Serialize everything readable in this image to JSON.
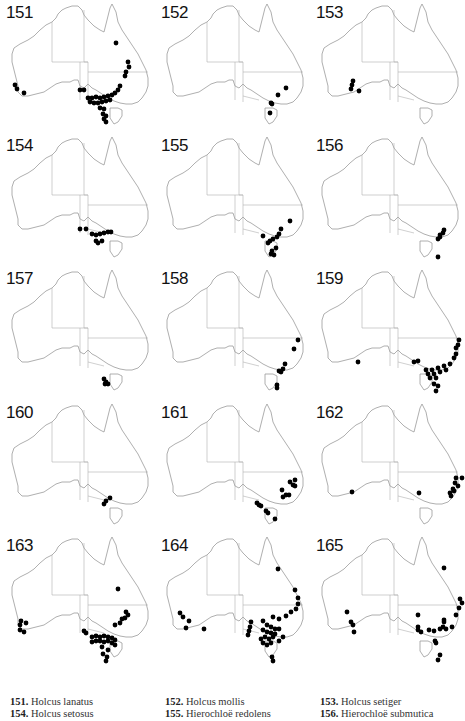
{
  "figure": {
    "type": "distribution-maps",
    "region": "Australia",
    "map_style": {
      "outline_color": "#9a9a9a",
      "border_color": "#b0b0b0",
      "dot_color": "#000000"
    }
  },
  "panels": [
    {
      "number": "151",
      "species": "Holcus lanatus",
      "dots": [
        [
          116,
          43
        ],
        [
          128,
          62
        ],
        [
          129,
          67
        ],
        [
          126,
          72
        ],
        [
          125,
          76
        ],
        [
          15,
          85
        ],
        [
          17,
          89
        ],
        [
          24,
          93
        ],
        [
          80,
          90
        ],
        [
          84,
          90
        ],
        [
          88,
          98
        ],
        [
          92,
          98
        ],
        [
          96,
          97
        ],
        [
          100,
          98
        ],
        [
          104,
          97
        ],
        [
          108,
          96
        ],
        [
          112,
          95
        ],
        [
          115,
          93
        ],
        [
          118,
          90
        ],
        [
          120,
          86
        ],
        [
          90,
          102
        ],
        [
          94,
          103
        ],
        [
          98,
          103
        ],
        [
          102,
          102
        ],
        [
          106,
          101
        ],
        [
          110,
          100
        ],
        [
          100,
          108
        ],
        [
          104,
          109
        ],
        [
          103,
          114
        ],
        [
          106,
          116
        ],
        [
          104,
          119
        ],
        [
          106,
          122
        ]
      ]
    },
    {
      "number": "152",
      "species": "Holcus mollis",
      "dots": [
        [
          131,
          88
        ],
        [
          123,
          95
        ],
        [
          116,
          103
        ],
        [
          117,
          104
        ],
        [
          115,
          113
        ]
      ]
    },
    {
      "number": "153",
      "species": "Holcus setiger",
      "dots": [
        [
          43,
          81
        ],
        [
          42,
          85
        ],
        [
          41,
          89
        ],
        [
          49,
          91
        ]
      ]
    },
    {
      "number": "154",
      "species": "Holcus setosus",
      "dots": [
        [
          80,
          96
        ],
        [
          86,
          96
        ],
        [
          92,
          101
        ],
        [
          96,
          102
        ],
        [
          100,
          101
        ],
        [
          104,
          100
        ],
        [
          108,
          99
        ],
        [
          111,
          99
        ],
        [
          96,
          108
        ],
        [
          102,
          108
        ],
        [
          98,
          110
        ]
      ]
    },
    {
      "number": "155",
      "species": "Hierochloë redolens",
      "dots": [
        [
          135,
          88
        ],
        [
          126,
          96
        ],
        [
          124,
          101
        ],
        [
          122,
          104
        ],
        [
          118,
          106
        ],
        [
          115,
          108
        ],
        [
          113,
          110
        ],
        [
          108,
          103
        ],
        [
          121,
          115
        ],
        [
          117,
          118
        ],
        [
          116,
          121
        ],
        [
          119,
          122
        ]
      ]
    },
    {
      "number": "156",
      "species": "Hierochloë submutica",
      "dots": [
        [
          134,
          97
        ],
        [
          133,
          100
        ],
        [
          130,
          102
        ],
        [
          130,
          104
        ],
        [
          128,
          106
        ],
        [
          128,
          124
        ]
      ]
    },
    {
      "number": "157",
      "species": "",
      "dots": [
        [
          104,
          113
        ],
        [
          106,
          116
        ],
        [
          105,
          118
        ],
        [
          108,
          118
        ]
      ]
    },
    {
      "number": "158",
      "species": "",
      "dots": [
        [
          143,
          74
        ],
        [
          139,
          83
        ],
        [
          130,
          98
        ],
        [
          128,
          103
        ],
        [
          124,
          105
        ],
        [
          126,
          106
        ],
        [
          122,
          119
        ],
        [
          122,
          122
        ]
      ]
    },
    {
      "number": "159",
      "species": "",
      "dots": [
        [
          149,
          74
        ],
        [
          148,
          79
        ],
        [
          146,
          82
        ],
        [
          104,
          96
        ],
        [
          108,
          95
        ],
        [
          48,
          96
        ],
        [
          116,
          104
        ],
        [
          122,
          104
        ],
        [
          128,
          102
        ],
        [
          134,
          100
        ],
        [
          140,
          98
        ],
        [
          144,
          92
        ],
        [
          146,
          88
        ],
        [
          118,
          108
        ],
        [
          124,
          108
        ],
        [
          130,
          106
        ],
        [
          136,
          104
        ],
        [
          120,
          112
        ],
        [
          126,
          112
        ],
        [
          124,
          118
        ],
        [
          128,
          120
        ],
        [
          126,
          125
        ]
      ]
    },
    {
      "number": "160",
      "species": "",
      "dots": [
        [
          110,
          98
        ],
        [
          106,
          101
        ],
        [
          104,
          104
        ]
      ]
    },
    {
      "number": "161",
      "species": "",
      "dots": [
        [
          140,
          80
        ],
        [
          135,
          82
        ],
        [
          138,
          85
        ],
        [
          140,
          86
        ],
        [
          127,
          90
        ],
        [
          131,
          95
        ],
        [
          134,
          95
        ],
        [
          128,
          97
        ],
        [
          102,
          103
        ],
        [
          104,
          105
        ],
        [
          106,
          106
        ],
        [
          111,
          111
        ],
        [
          120,
          119
        ],
        [
          113,
          113
        ]
      ]
    },
    {
      "number": "162",
      "species": "",
      "dots": [
        [
          42,
          92
        ],
        [
          109,
          93
        ],
        [
          146,
          78
        ],
        [
          152,
          78
        ],
        [
          145,
          83
        ],
        [
          148,
          86
        ],
        [
          143,
          89
        ],
        [
          144,
          91
        ],
        [
          141,
          96
        ],
        [
          140,
          93
        ]
      ]
    },
    {
      "number": "163",
      "species": "",
      "dots": [
        [
          118,
          56
        ],
        [
          126,
          79
        ],
        [
          128,
          82
        ],
        [
          125,
          85
        ],
        [
          122,
          86
        ],
        [
          120,
          90
        ],
        [
          115,
          92
        ],
        [
          21,
          88
        ],
        [
          26,
          90
        ],
        [
          20,
          92
        ],
        [
          20,
          97
        ],
        [
          24,
          99
        ],
        [
          84,
          98
        ],
        [
          86,
          100
        ],
        [
          92,
          104
        ],
        [
          96,
          103
        ],
        [
          100,
          104
        ],
        [
          104,
          103
        ],
        [
          108,
          104
        ],
        [
          112,
          105
        ],
        [
          115,
          107
        ],
        [
          92,
          109
        ],
        [
          96,
          108
        ],
        [
          100,
          108
        ],
        [
          104,
          109
        ],
        [
          108,
          108
        ],
        [
          112,
          110
        ],
        [
          115,
          112
        ],
        [
          102,
          114
        ],
        [
          108,
          117
        ],
        [
          103,
          121
        ],
        [
          107,
          124
        ],
        [
          106,
          128
        ]
      ]
    },
    {
      "number": "164",
      "species": "",
      "dots": [
        [
          123,
          36
        ],
        [
          140,
          57
        ],
        [
          143,
          65
        ],
        [
          143,
          71
        ],
        [
          141,
          76
        ],
        [
          136,
          79
        ],
        [
          131,
          83
        ],
        [
          118,
          84
        ],
        [
          124,
          86
        ],
        [
          25,
          80
        ],
        [
          28,
          84
        ],
        [
          34,
          88
        ],
        [
          31,
          95
        ],
        [
          49,
          96
        ],
        [
          96,
          89
        ],
        [
          95,
          94
        ],
        [
          94,
          98
        ],
        [
          93,
          102
        ],
        [
          108,
          88
        ],
        [
          112,
          92
        ],
        [
          116,
          94
        ],
        [
          120,
          96
        ],
        [
          124,
          96
        ],
        [
          108,
          97
        ],
        [
          112,
          99
        ],
        [
          116,
          100
        ],
        [
          120,
          101
        ],
        [
          110,
          104
        ],
        [
          114,
          106
        ],
        [
          118,
          104
        ],
        [
          106,
          106
        ],
        [
          108,
          110
        ],
        [
          112,
          112
        ],
        [
          116,
          110
        ],
        [
          124,
          108
        ],
        [
          128,
          104
        ],
        [
          117,
          124
        ],
        [
          118,
          128
        ]
      ]
    },
    {
      "number": "165",
      "species": "",
      "dots": [
        [
          134,
          35
        ],
        [
          150,
          66
        ],
        [
          152,
          70
        ],
        [
          149,
          75
        ],
        [
          146,
          82
        ],
        [
          134,
          87
        ],
        [
          37,
          79
        ],
        [
          41,
          89
        ],
        [
          43,
          92
        ],
        [
          44,
          99
        ],
        [
          108,
          82
        ],
        [
          108,
          94
        ],
        [
          108,
          97
        ],
        [
          111,
          99
        ],
        [
          119,
          97
        ],
        [
          134,
          89
        ],
        [
          124,
          98
        ],
        [
          130,
          96
        ],
        [
          133,
          94
        ],
        [
          136,
          96
        ],
        [
          142,
          94
        ],
        [
          125,
          108
        ],
        [
          126,
          110
        ],
        [
          130,
          122
        ],
        [
          128,
          127
        ]
      ]
    }
  ],
  "caption": {
    "entries": [
      {
        "number": "151.",
        "name": "Holcus lanatus"
      },
      {
        "number": "152.",
        "name": "Holcus mollis"
      },
      {
        "number": "153.",
        "name": "Holcus setiger"
      },
      {
        "number": "154.",
        "name": "Holcus setosus"
      },
      {
        "number": "155.",
        "name": "Hierochloë redolens"
      },
      {
        "number": "156.",
        "name": "Hierochloë submutica"
      }
    ]
  }
}
